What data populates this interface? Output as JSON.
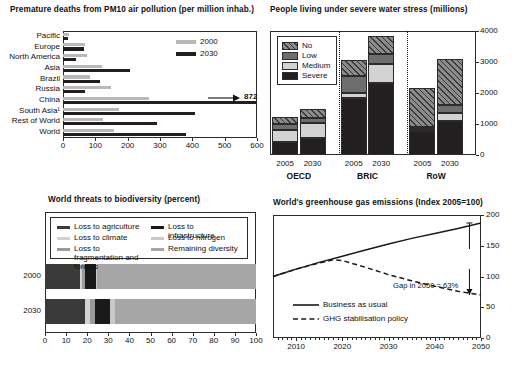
{
  "figure": {
    "background": "#ffffff",
    "colors": {
      "light_gray": "#b9b9b9",
      "mid_gray": "#8c8c8c",
      "dark_gray": "#6e6e6e",
      "near_black": "#231f20",
      "pale_gray": "#d2d2d2",
      "axis": "#2b2b2b"
    }
  },
  "panels": {
    "pm10": {
      "title": "Premature deaths from PM10 air pollution (per million inhab.)",
      "chart_data": {
        "type": "bar",
        "orientation": "horizontal",
        "title": "Premature deaths from PM10 air pollution (per million inhab.)",
        "xlabel": "",
        "ylabel": "",
        "xlim": [
          0,
          600
        ],
        "xticks": [
          0,
          100,
          200,
          300,
          400,
          500,
          600
        ],
        "grid": false,
        "legend_position": "top-right",
        "categories": [
          "Pacific",
          "Europe",
          "North America",
          "Asia",
          "Brazil",
          "Russia",
          "China",
          "South Asia¹",
          "Rest of World",
          "World"
        ],
        "series": [
          {
            "name": "2000",
            "color": "#b9b9b9",
            "values": [
              18,
              68,
              75,
              122,
              85,
              148,
              265,
              172,
              125,
              158
            ]
          },
          {
            "name": "2030",
            "color": "#231f20",
            "values": [
              14,
              65,
              40,
              208,
              113,
              68,
              872,
              408,
              292,
              380
            ]
          }
        ],
        "annotations": [
          {
            "text": "872",
            "series": "2030",
            "category": "China",
            "note": "value exceeds axis; arrow points right to label"
          }
        ]
      }
    },
    "water": {
      "title": "People living under severe water stress (millions)",
      "chart_data": {
        "type": "bar",
        "subtype": "stacked",
        "orientation": "vertical",
        "title": "People living under severe water stress (millions)",
        "xlabel": "",
        "ylabel": "",
        "ylim": [
          0,
          4000
        ],
        "yticks": [
          0,
          1000,
          2000,
          3000,
          4000
        ],
        "grid": false,
        "legend_position": "top-left",
        "categories": [
          "2005",
          "2030",
          "2005",
          "2030",
          "2005",
          "2030"
        ],
        "groups": [
          {
            "name": "OECD",
            "members": [
              "2005",
              "2030"
            ]
          },
          {
            "name": "BRIC",
            "members": [
              "2005",
              "2030"
            ]
          },
          {
            "name": "RoW",
            "members": [
              "2005",
              "2030"
            ]
          }
        ],
        "series": [
          {
            "name": "Severe",
            "color": "#231f20",
            "pattern": "solid",
            "values": [
              420,
              560,
              1830,
              2330,
              790,
              1090
            ]
          },
          {
            "name": "Medium",
            "color": "#d2d2d2",
            "pattern": "solid",
            "values": [
              400,
              480,
              160,
              600,
              60,
              280
            ]
          },
          {
            "name": "Low",
            "color": "#6e6e6e",
            "pattern": "solid",
            "values": [
              190,
              140,
              560,
              340,
              50,
              230
            ]
          },
          {
            "name": "No",
            "color": "#8c8c8c",
            "pattern": "hatch",
            "values": [
              230,
              310,
              520,
              570,
              1270,
              1490
            ]
          }
        ],
        "totals": [
          1240,
          1490,
          3070,
          3840,
          2170,
          3090
        ]
      }
    },
    "biodiversity": {
      "title": "World threats to biodiversity (percent)",
      "chart_data": {
        "type": "bar",
        "subtype": "stacked",
        "orientation": "horizontal",
        "title": "World threats to biodiversity (percent)",
        "xlabel": "",
        "ylabel": "",
        "xlim": [
          0,
          100
        ],
        "xticks": [
          0,
          10,
          20,
          30,
          40,
          50,
          60,
          70,
          80,
          90,
          100
        ],
        "grid": false,
        "legend_position": "inside-top",
        "categories": [
          "2000",
          "2030"
        ],
        "series": [
          {
            "name": "Loss to agriculture",
            "color": "#3a3a3a",
            "values": [
              16.5,
              19.0
            ]
          },
          {
            "name": "Loss to climate",
            "color": "#d2d2d2",
            "values": [
              1.0,
              2.5
            ]
          },
          {
            "name": "Loss to fragmentation and forests",
            "color": "#9a9a9a",
            "values": [
              1.5,
              2.0
            ]
          },
          {
            "name": "Loss to infrastructure",
            "color": "#1a1a1a",
            "values": [
              5.0,
              7.5
            ]
          },
          {
            "name": "Loss to nitrogen",
            "color": "#c9c9c9",
            "values": [
              0.5,
              2.0
            ]
          },
          {
            "name": "Remaining diversity",
            "color": "#a6a6a6",
            "values": [
              75.5,
              67.0
            ]
          }
        ]
      }
    },
    "ghg": {
      "title": "World's greenhouse gas emissions (Index 2005=100)",
      "annotation": "Gap in 2050 = 63%",
      "chart_data": {
        "type": "line",
        "title": "World's greenhouse gas emissions (Index 2005=100)",
        "xlabel": "",
        "ylabel": "",
        "xlim": [
          2005,
          2050
        ],
        "ylim": [
          0,
          200
        ],
        "xticks": [
          2010,
          2020,
          2030,
          2040,
          2050
        ],
        "yticks": [
          0,
          50,
          100,
          150,
          200
        ],
        "grid": false,
        "legend_position": "bottom-left",
        "annotations": [
          {
            "text": "Gap in 2050 = 63%",
            "x": 2040,
            "y": 112
          }
        ],
        "series": [
          {
            "name": "Business as usual",
            "style": "solid",
            "color": "#1a1a1a",
            "x": [
              2005,
              2010,
              2015,
              2020,
              2025,
              2030,
              2035,
              2040,
              2045,
              2050
            ],
            "values": [
              100,
              112,
              123,
              133,
              143,
              153,
              162,
              170,
              178,
              187
            ]
          },
          {
            "name": "GHG stabilisation policy",
            "style": "dashed",
            "color": "#1a1a1a",
            "x": [
              2005,
              2010,
              2015,
              2018,
              2020,
              2025,
              2030,
              2035,
              2040,
              2045,
              2050
            ],
            "values": [
              100,
              112,
              122,
              127,
              126,
              115,
              103,
              93,
              84,
              76,
              70
            ]
          }
        ]
      }
    }
  }
}
